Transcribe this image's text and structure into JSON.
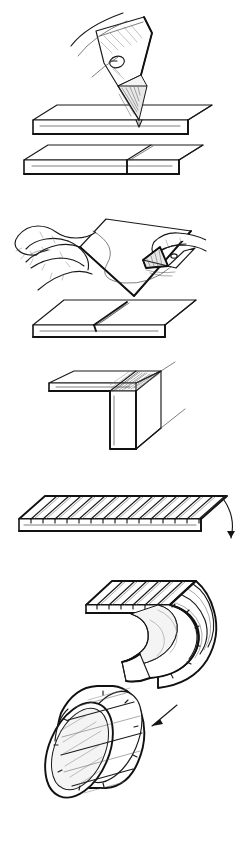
{
  "figure": {
    "title": "Scoring and rolling a kerfed sheet into a tube",
    "background_color": "#ffffff",
    "ink_color": "#1a1a1a",
    "width": 243,
    "height": 846,
    "style": "technical pen-and-ink line illustration, no captions or text labels",
    "sections": [
      {
        "id": "upper",
        "name": "cutting-and-folding-sequence",
        "panel_count": 3
      },
      {
        "id": "lower",
        "name": "kerfing-and-rolling-sequence",
        "panel_count": 2
      }
    ],
    "panels": [
      {
        "index": 1,
        "id": "panel-knife-cut",
        "name": "craft-knife-cutting-board",
        "description": "A craft knife blade with a circular finger hole cuts straight down into the face of a flat rectangular board shown in isometric view; a second identical board below shows the completed cut as a vertical parting line.",
        "objects": [
          "craft-knife",
          "knife-blade",
          "blade-hole",
          "board-top",
          "board-cut",
          "cut-line"
        ]
      },
      {
        "index": 2,
        "id": "panel-hand-scoring",
        "name": "hand-scoring-sheet",
        "description": "A left hand steadies a thin sheet while a knife held in the right hand scores a long curved line across its surface; below, a flat board shows the resulting single score groove.",
        "objects": [
          "left-hand",
          "right-hand",
          "knife",
          "sheet",
          "score-curve",
          "board-scored",
          "score-groove"
        ]
      },
      {
        "index": 3,
        "id": "panel-right-angle-fold",
        "name": "right-angle-fold",
        "description": "The scored board folded into a crisp ninety-degree L profile, with hatched kerf teeth visible along the folded top edge.",
        "objects": [
          "folded-board",
          "fold-corner",
          "kerf-hatching"
        ]
      },
      {
        "index": 4,
        "id": "panel-kerfed-sheet",
        "name": "kerfed-flat-sheet",
        "description": "A flat rectangular sheet in isometric view ruled with many evenly spaced parallel saw kerfs running across its width; a curved arrow at the right edge indicates the direction of rolling.",
        "objects": [
          "flat-sheet",
          "kerf-grooves",
          "sheet-edge",
          "curved-arrow"
        ],
        "kerf_count": 15
      },
      {
        "index": 5,
        "id": "panel-rolled-tube",
        "name": "rolling-into-tube",
        "description": "The kerfed sheet curled into a deep J-shaped half roll, and beside it the finished hollow cylindrical tube with visible wall thickness; a straight arrow points from the curled sheet toward the finished tube.",
        "objects": [
          "curled-sheet",
          "curl-inner-face",
          "finished-tube",
          "tube-bore",
          "tube-wall",
          "straight-arrow"
        ]
      }
    ],
    "annotations": [
      {
        "id": "arrow-roll",
        "name": "curved-roll-arrow",
        "kind": "curved-arrow",
        "direction": "downward-curving",
        "meaning": "roll the sheet in this direction"
      },
      {
        "id": "arrow-result",
        "name": "straight-result-arrow",
        "kind": "straight-arrow",
        "direction": "down-left",
        "meaning": "resulting finished tube"
      }
    ]
  }
}
